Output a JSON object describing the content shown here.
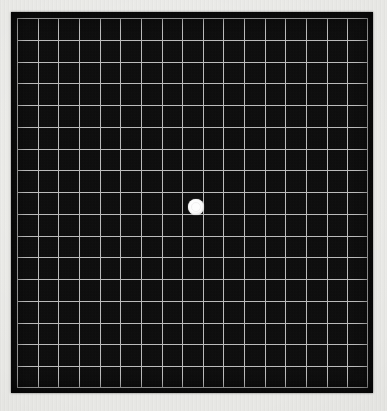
{
  "chart_data": {
    "type": "table",
    "columns": 17,
    "rows": 17,
    "cell_size_px": 20.7,
    "grid_line_color": "#c2c2c2",
    "grid_line_width_px": 1,
    "field_color": "#0b0b0b",
    "background_color": "#e9e9e6",
    "fixation_dot": {
      "label": "central fixation dot",
      "color": "#fdfdfd",
      "center_x_px": 196,
      "center_y_px": 207,
      "diameter_px": 16,
      "grid_column": 9,
      "grid_row": 9
    },
    "panel": {
      "left_px": 11,
      "top_px": 12,
      "width_px": 362,
      "height_px": 381,
      "border_inset_px": 6
    },
    "grid_area": {
      "left_px": 17,
      "top_px": 18,
      "width_px": 351,
      "height_px": 370
    },
    "xlabel": "",
    "ylabel": "",
    "legend": [],
    "annotations": []
  },
  "chart": {
    "panel_label": "amsler-grid-field",
    "dot_label": "central fixation dot"
  }
}
